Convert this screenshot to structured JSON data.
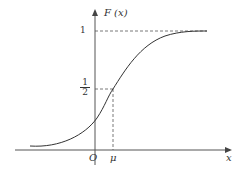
{
  "diagram": {
    "title": "",
    "y_axis_label": "F (x)",
    "x_axis_label": "x",
    "origin_label": "O",
    "mu_label": "μ",
    "tick_one": "1",
    "tick_half_num": "1",
    "tick_half_den": "2"
  },
  "colors": {
    "line": "#333333",
    "dashed": "#555555",
    "background": "#ffffff"
  }
}
